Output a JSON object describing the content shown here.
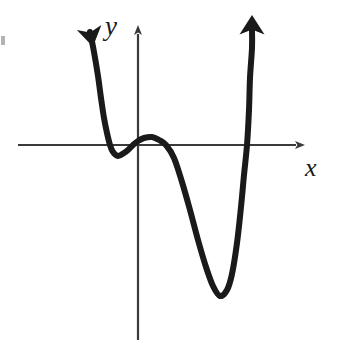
{
  "figure": {
    "width": 343,
    "height": 352,
    "background_color": "#ffffff",
    "curve_color": "#1a1a1a",
    "axis_color": "#3a3a3a"
  },
  "axes": {
    "x_axis": {
      "label": "x",
      "label_position": {
        "x": 315,
        "y": 170
      },
      "line_y": 145,
      "line_x_start": 18,
      "line_x_end": 300,
      "arrow": "right",
      "ticks": [],
      "tick_labels": []
    },
    "y_axis": {
      "label": "y",
      "label_position": {
        "x": 116,
        "y": 30
      },
      "line_x": 138,
      "line_y_start": 28,
      "line_y_end": 340,
      "arrow": "up",
      "ticks": [],
      "tick_labels": []
    },
    "origin": {
      "x": 138,
      "y": 145
    },
    "grid": false
  },
  "chart_data": {
    "type": "line",
    "title": "",
    "subtitle": "",
    "xlabel": "x",
    "ylabel": "y",
    "grid": false,
    "legend": null,
    "legend_position": "none",
    "axis_ticks_shown": false,
    "series": [
      {
        "name": "quartic-curve",
        "color": "#1a1a1a",
        "line_width": 6,
        "arrow_start": true,
        "arrow_end": true,
        "points": [
          {
            "x": 90,
            "y": 32
          },
          {
            "x": 94,
            "y": 52
          },
          {
            "x": 98,
            "y": 76
          },
          {
            "x": 101,
            "y": 98
          },
          {
            "x": 104,
            "y": 118
          },
          {
            "x": 107,
            "y": 133
          },
          {
            "x": 110,
            "y": 145
          },
          {
            "x": 113,
            "y": 152
          },
          {
            "x": 118,
            "y": 156
          },
          {
            "x": 124,
            "y": 153
          },
          {
            "x": 129,
            "y": 149
          },
          {
            "x": 133,
            "y": 145
          },
          {
            "x": 138,
            "y": 141
          },
          {
            "x": 144,
            "y": 138
          },
          {
            "x": 152,
            "y": 137
          },
          {
            "x": 159,
            "y": 140
          },
          {
            "x": 166,
            "y": 145
          },
          {
            "x": 174,
            "y": 158
          },
          {
            "x": 182,
            "y": 182
          },
          {
            "x": 190,
            "y": 210
          },
          {
            "x": 198,
            "y": 240
          },
          {
            "x": 206,
            "y": 267
          },
          {
            "x": 213,
            "y": 286
          },
          {
            "x": 220,
            "y": 296
          },
          {
            "x": 227,
            "y": 290
          },
          {
            "x": 232,
            "y": 274
          },
          {
            "x": 237,
            "y": 243
          },
          {
            "x": 241,
            "y": 207
          },
          {
            "x": 244,
            "y": 175
          },
          {
            "x": 247,
            "y": 145
          },
          {
            "x": 249,
            "y": 110
          },
          {
            "x": 250,
            "y": 78
          },
          {
            "x": 252,
            "y": 48
          },
          {
            "x": 252,
            "y": 30
          }
        ],
        "key_features": {
          "left_local_minimum": {
            "x": 118,
            "y": 156
          },
          "local_maximum": {
            "x": 152,
            "y": 137
          },
          "global_minimum": {
            "x": 220,
            "y": 296
          },
          "x_intercepts": [
            110,
            133,
            166,
            247
          ],
          "arrow_tip_left": {
            "x": 90,
            "y": 32
          },
          "arrow_tip_right": {
            "x": 252,
            "y": 30
          }
        }
      }
    ]
  }
}
